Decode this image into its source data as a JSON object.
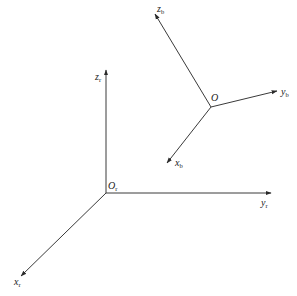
{
  "diagram": {
    "type": "coordinate-frames",
    "colors": {
      "line": "#3a3a3a",
      "text": "#222222",
      "background": "#ffffff"
    },
    "frames": [
      {
        "name": "reference-frame",
        "origin_label": "O",
        "origin_sub": "r",
        "axes": [
          {
            "label": "x",
            "sub": "r"
          },
          {
            "label": "y",
            "sub": "r"
          },
          {
            "label": "z",
            "sub": "r"
          }
        ]
      },
      {
        "name": "body-frame",
        "origin_label": "O",
        "origin_sub": "",
        "axes": [
          {
            "label": "x",
            "sub": "b"
          },
          {
            "label": "y",
            "sub": "b"
          },
          {
            "label": "z",
            "sub": "b"
          }
        ]
      }
    ]
  }
}
